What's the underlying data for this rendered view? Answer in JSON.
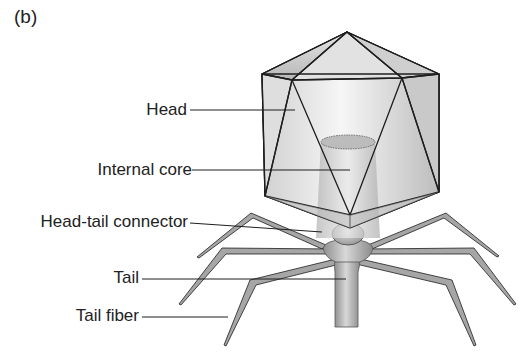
{
  "figure": {
    "panel_label": "(b)",
    "labels": [
      {
        "id": "head",
        "text": "Head"
      },
      {
        "id": "internal-core",
        "text": "Internal core"
      },
      {
        "id": "head-tail-connector",
        "text": "Head-tail connector"
      },
      {
        "id": "tail",
        "text": "Tail"
      },
      {
        "id": "tail-fiber",
        "text": "Tail fiber"
      }
    ]
  },
  "colors": {
    "outline": "#1e1e1e",
    "fill_light": "#eeeeee",
    "fill_mid": "#c8c8c8",
    "fill_dark": "#9a9a9a",
    "text": "#222222"
  }
}
